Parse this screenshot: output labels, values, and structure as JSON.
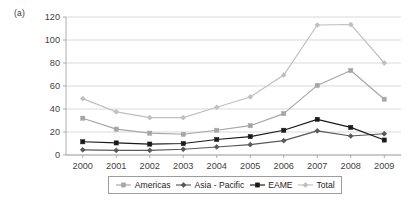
{
  "panel": {
    "label": "(a)"
  },
  "legend": {
    "position": "bottom",
    "entries": [
      {
        "name": "Americas",
        "marker": "square",
        "color": "#a6a6a6"
      },
      {
        "name": "Asia - Pacific",
        "marker": "diamond",
        "color": "#595959"
      },
      {
        "name": "EAME",
        "marker": "square",
        "color": "#1a1a1a"
      },
      {
        "name": "Total",
        "marker": "diamond",
        "color": "#bfbfbf"
      }
    ]
  },
  "axes": {
    "y_ticks": [
      "0",
      "20",
      "40",
      "60",
      "80",
      "100",
      "120"
    ],
    "x_ticks": [
      "2000",
      "2001",
      "2002",
      "2003",
      "2004",
      "2005",
      "2006",
      "2007",
      "2008",
      "2009"
    ]
  },
  "chart_data": {
    "type": "line",
    "title": "(a)",
    "xlabel": "",
    "ylabel": "",
    "categories": [
      "2000",
      "2001",
      "2002",
      "2003",
      "2004",
      "2005",
      "2006",
      "2007",
      "2008",
      "2009"
    ],
    "x": [
      2000,
      2001,
      2002,
      2003,
      2004,
      2005,
      2006,
      2007,
      2008,
      2009
    ],
    "series": [
      {
        "name": "Americas",
        "color": "#a6a6a6",
        "marker": "square",
        "values": [
          32,
          22.5,
          19,
          18,
          21.5,
          25.5,
          36,
          60.5,
          73.5,
          48.5
        ]
      },
      {
        "name": "Asia - Pacific",
        "color": "#595959",
        "marker": "diamond",
        "values": [
          4.5,
          4,
          4,
          5,
          7,
          9,
          12.5,
          21,
          16.5,
          18.5
        ]
      },
      {
        "name": "EAME",
        "color": "#1a1a1a",
        "marker": "square",
        "values": [
          11.5,
          10.5,
          9.5,
          10,
          13.5,
          16,
          21.5,
          31,
          24,
          13
        ]
      },
      {
        "name": "Total",
        "color": "#bfbfbf",
        "marker": "diamond",
        "values": [
          49,
          37.5,
          32.5,
          32.5,
          41.5,
          50.5,
          69.5,
          113,
          113.5,
          80
        ]
      }
    ],
    "ylim": [
      0,
      120
    ],
    "ytick_step": 20,
    "grid": "horizontal",
    "legend_position": "bottom"
  }
}
